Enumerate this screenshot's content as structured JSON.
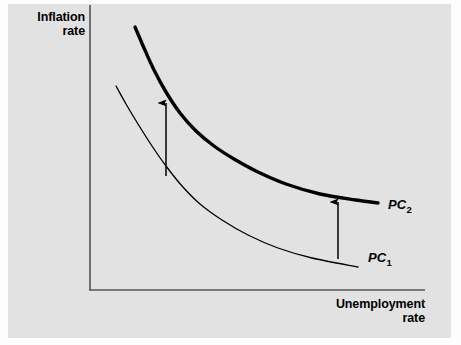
{
  "figure": {
    "panel_bg": "#e2e2e2",
    "ink": "#000000",
    "axis_color": "#555555"
  },
  "axes": {
    "y_label": "Inflation\nrate",
    "x_label": "Unemployment\nrate"
  },
  "labels": {
    "pc1_text": "PC",
    "pc1_sub": "1",
    "pc2_text": "PC",
    "pc2_sub": "2"
  },
  "chart_data": {
    "type": "line",
    "title": "",
    "xlabel": "Unemployment rate",
    "ylabel": "Inflation rate",
    "grid": false,
    "legend": "inline-curve-labels",
    "axis_ticks": [],
    "xlim": [
      0,
      1
    ],
    "ylim": [
      0,
      1
    ],
    "series": [
      {
        "name": "PC1",
        "label": "PC₁",
        "style": "thin",
        "stroke_width": 1.3,
        "color": "#000000",
        "points": [
          [
            116,
            86
          ],
          [
            126,
            104
          ],
          [
            138,
            124
          ],
          [
            152,
            146
          ],
          [
            166,
            166
          ],
          [
            182,
            186
          ],
          [
            200,
            204
          ],
          [
            222,
            220
          ],
          [
            248,
            235
          ],
          [
            278,
            248
          ],
          [
            312,
            258
          ],
          [
            358,
            267
          ]
        ]
      },
      {
        "name": "PC2",
        "label": "PC₂",
        "style": "thick",
        "stroke_width": 3.4,
        "color": "#000000",
        "points": [
          [
            135,
            27
          ],
          [
            144,
            48
          ],
          [
            154,
            70
          ],
          [
            166,
            92
          ],
          [
            180,
            113
          ],
          [
            196,
            131
          ],
          [
            214,
            146
          ],
          [
            234,
            159
          ],
          [
            258,
            172
          ],
          [
            286,
            184
          ],
          [
            320,
            194
          ],
          [
            356,
            200
          ],
          [
            378,
            203
          ]
        ]
      }
    ],
    "annotations": [
      {
        "type": "arrow",
        "name": "shift-arrow-left",
        "x": 166,
        "y_start": 176,
        "y_end": 103,
        "direction": "up"
      },
      {
        "type": "arrow",
        "name": "shift-arrow-right",
        "x": 338,
        "y_start": 259,
        "y_end": 202,
        "direction": "up"
      }
    ],
    "axis_lines": {
      "y_axis": {
        "x": 90,
        "y_top": 5,
        "y_bottom": 290
      },
      "x_axis": {
        "y": 290,
        "x_left": 90,
        "x_right": 425
      }
    }
  }
}
